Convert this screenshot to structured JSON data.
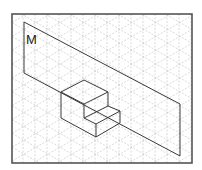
{
  "figure": {
    "plane_label": "M",
    "colors": {
      "frame": "#555555",
      "grid": "#c8c8c8",
      "lines": "#3a3a3a",
      "background": "#ffffff"
    },
    "frame": {
      "x": 12,
      "y": 14,
      "width": 180,
      "height": 149
    },
    "plane_polygon": [
      [
        24,
        22
      ],
      [
        180,
        104
      ],
      [
        180,
        156
      ],
      [
        24,
        73
      ]
    ],
    "solid_edges": [
      [
        [
          61,
          92
        ],
        [
          84,
          80
        ]
      ],
      [
        [
          84,
          80
        ],
        [
          108,
          92
        ]
      ],
      [
        [
          108,
          92
        ],
        [
          84,
          104
        ]
      ],
      [
        [
          84,
          104
        ],
        [
          61,
          92
        ]
      ],
      [
        [
          61,
          92
        ],
        [
          61,
          118
        ]
      ],
      [
        [
          84,
          104
        ],
        [
          84,
          118
        ]
      ],
      [
        [
          108,
          92
        ],
        [
          108,
          106
        ]
      ],
      [
        [
          84,
          118
        ],
        [
          108,
          106
        ]
      ],
      [
        [
          108,
          106
        ],
        [
          120,
          111
        ]
      ],
      [
        [
          84,
          118
        ],
        [
          96,
          124
        ]
      ],
      [
        [
          96,
          124
        ],
        [
          120,
          111
        ]
      ],
      [
        [
          120,
          111
        ],
        [
          120,
          123
        ]
      ],
      [
        [
          96,
          124
        ],
        [
          96,
          137
        ]
      ],
      [
        [
          61,
          118
        ],
        [
          96,
          137
        ]
      ],
      [
        [
          96,
          137
        ],
        [
          120,
          123
        ]
      ]
    ]
  }
}
